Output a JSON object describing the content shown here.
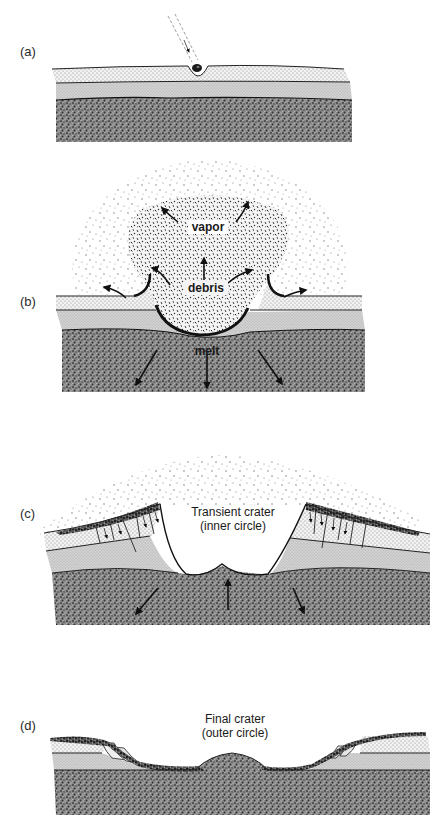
{
  "figure": {
    "panels": [
      {
        "id": "a",
        "label": "(a)",
        "description": "Meteorite impacting layered surface"
      },
      {
        "id": "b",
        "label": "(b)",
        "labels": {
          "vapor": "vapor",
          "debris": "debris",
          "melt": "melt"
        }
      },
      {
        "id": "c",
        "label": "(c)",
        "caption_line1": "Transient crater",
        "caption_line2": "(inner circle)"
      },
      {
        "id": "d",
        "label": "(d)",
        "caption_line1": "Final crater",
        "caption_line2": "(outer circle)"
      }
    ],
    "layers": [
      {
        "name": "top-layer",
        "pattern": "fine-dots",
        "color": "#d9d9d9"
      },
      {
        "name": "middle-layer",
        "pattern": "light-grey-stipple",
        "color": "#bfbfbf"
      },
      {
        "name": "bedrock",
        "pattern": "dense-dark-stipple",
        "color": "#6e6e6e"
      }
    ],
    "colors": {
      "ink": "#1a1a1a",
      "background": "#ffffff"
    }
  }
}
